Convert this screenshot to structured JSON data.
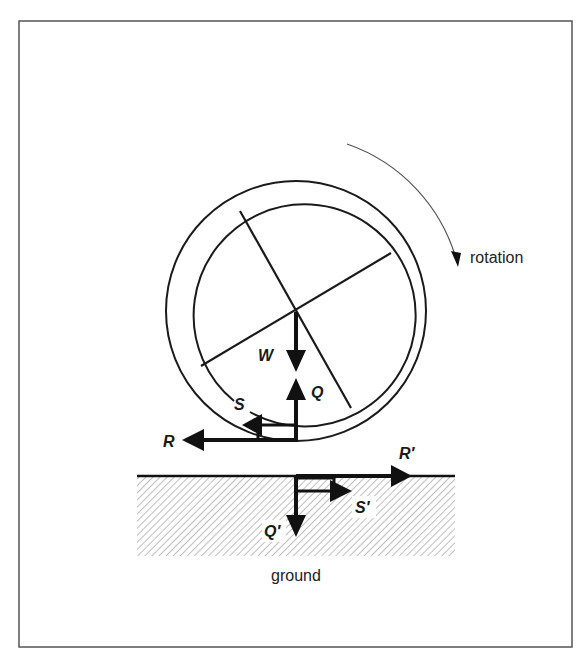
{
  "diagram": {
    "labels": {
      "rotation": "rotation",
      "ground": "ground",
      "W": "W",
      "Q": "Q",
      "S": "S",
      "R": "R",
      "R_prime": "R′",
      "S_prime": "S′",
      "Q_prime": "Q′"
    },
    "elements": {
      "wheel": {
        "center": [
          296,
          311
        ],
        "outer_radius": 130,
        "inner_radius": 111,
        "spokes": 2
      },
      "rotation_direction": "clockwise",
      "forces_on_wheel": [
        {
          "name": "W",
          "direction": "down",
          "description": "weight"
        },
        {
          "name": "Q",
          "direction": "up",
          "description": "normal reaction"
        },
        {
          "name": "S",
          "direction": "left"
        },
        {
          "name": "R",
          "direction": "left"
        }
      ],
      "forces_on_ground": [
        {
          "name": "R′",
          "direction": "right"
        },
        {
          "name": "S′",
          "direction": "right"
        },
        {
          "name": "Q′",
          "direction": "down"
        }
      ]
    },
    "colors": {
      "ink": "#111111",
      "frame": "#555555",
      "hatch": "#888888",
      "background": "#ffffff"
    }
  }
}
